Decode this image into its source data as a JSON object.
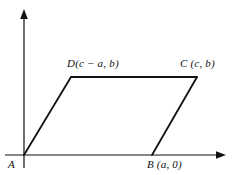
{
  "figure": {
    "type": "geometry-diagram",
    "background_color": "#ffffff",
    "stroke_color": "#111111",
    "axes": {
      "x_axis": {
        "name": "x-axis",
        "y": 155,
        "x_start": 5,
        "x_end": 225,
        "arrow": "right"
      },
      "y_axis": {
        "name": "y-axis",
        "x": 24,
        "y_start": 168,
        "y_end": 10,
        "arrow": "up"
      }
    },
    "vertices": [
      {
        "id": "A",
        "label": "A",
        "px": 24,
        "py": 155,
        "coords": "origin"
      },
      {
        "id": "B",
        "label": "B (a, 0)",
        "px": 152,
        "py": 155,
        "coords": "(a, 0)"
      },
      {
        "id": "C",
        "label": "C (c, b)",
        "px": 197,
        "py": 77,
        "coords": "(c, b)"
      },
      {
        "id": "D",
        "label": "D(c − a, b)",
        "px": 71,
        "py": 77,
        "coords": "(c − a, b)"
      }
    ],
    "edges": [
      {
        "from": "A",
        "to": "B"
      },
      {
        "from": "B",
        "to": "C"
      },
      {
        "from": "C",
        "to": "D"
      },
      {
        "from": "D",
        "to": "A"
      }
    ],
    "labels": {
      "a": "A",
      "b": "B (a, 0)",
      "c": "C (c, b)",
      "d": "D(c − a, b)"
    }
  }
}
